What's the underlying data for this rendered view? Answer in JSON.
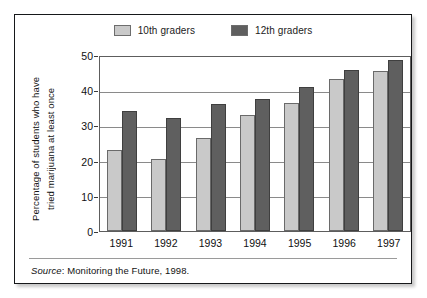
{
  "chart_data": {
    "type": "bar",
    "title": "",
    "xlabel": "",
    "ylabel_line1": "Percentage of students who have",
    "ylabel_line2": "tried marijuana at least once",
    "categories": [
      "1991",
      "1992",
      "1993",
      "1994",
      "1995",
      "1996",
      "1997"
    ],
    "series": [
      {
        "name": "10th graders",
        "color": "#c9c9c9",
        "values": [
          23,
          20.4,
          26.4,
          33.1,
          36.4,
          43.3,
          45.6
        ]
      },
      {
        "name": "12th graders",
        "color": "#5f5f5f",
        "values": [
          34.2,
          32.0,
          36.0,
          37.4,
          41.0,
          45.8,
          48.7
        ]
      }
    ],
    "ylim": [
      0,
      50
    ],
    "yticks": [
      0,
      10,
      20,
      30,
      40,
      50
    ],
    "ytick_labels": [
      "0",
      "10",
      "20",
      "30",
      "40",
      "50"
    ],
    "grid": true,
    "legend_position": "top-center"
  },
  "legend": {
    "items": [
      {
        "label": "10th graders",
        "color": "#c9c9c9"
      },
      {
        "label": "12th graders",
        "color": "#5f5f5f"
      }
    ]
  },
  "footer": {
    "source_word": "Source",
    "source_separator": ": ",
    "source_text": "Monitoring the Future, 1998."
  }
}
